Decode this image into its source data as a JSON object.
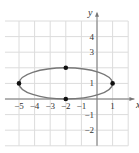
{
  "chart_data": {
    "type": "line",
    "title": "",
    "xlabel": "x",
    "ylabel": "y",
    "xlim": [
      -6,
      2
    ],
    "ylim": [
      -3,
      5
    ],
    "grid": true,
    "x_ticks": [
      "-5",
      "-4",
      "-3",
      "-2",
      "-1",
      "1"
    ],
    "y_ticks": [
      "4",
      "3",
      "1",
      "-1",
      "-2"
    ],
    "series": [
      {
        "name": "ellipse",
        "shape": "ellipse",
        "center": [
          -2,
          1
        ],
        "semi_major_x": 3,
        "semi_minor_y": 1,
        "color": "#777777"
      }
    ],
    "points": [
      {
        "x": -5,
        "y": 1
      },
      {
        "x": 1,
        "y": 1
      },
      {
        "x": -2,
        "y": 2
      },
      {
        "x": -2,
        "y": 0
      }
    ]
  }
}
